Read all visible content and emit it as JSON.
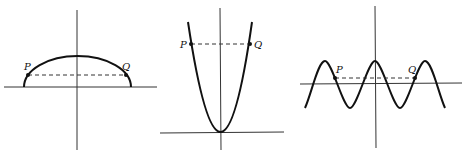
{
  "figure": {
    "panels": [
      {
        "name": "semi-ellipse",
        "curve_type": "upper half of ellipse",
        "points": [
          {
            "label": "P"
          },
          {
            "label": "Q"
          }
        ]
      },
      {
        "name": "parabola",
        "curve_type": "upward parabola with vertex at origin",
        "points": [
          {
            "label": "P"
          },
          {
            "label": "Q"
          }
        ]
      },
      {
        "name": "cosine-wave",
        "curve_type": "cosine-like periodic wave",
        "points": [
          {
            "label": "P"
          },
          {
            "label": "Q"
          }
        ]
      }
    ]
  }
}
